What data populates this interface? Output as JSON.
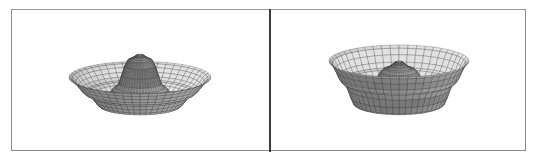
{
  "figure": {
    "panels": [
      {
        "id": "left",
        "caption": ""
      },
      {
        "id": "right",
        "caption": ""
      }
    ]
  },
  "chart_data": [
    {
      "type": "surface3d",
      "title": "",
      "style": "shaded wireframe mesh",
      "description": "Radially symmetric surface with a central peak and an upturned outer rim (sombrero-like)",
      "profile": {
        "r": [
          0,
          0.15,
          0.35,
          0.55,
          0.75,
          1.0
        ],
        "z": [
          1.0,
          0.9,
          0.35,
          0.0,
          0.25,
          0.55
        ]
      },
      "mesh": {
        "radial_lines": 24,
        "rings": 22
      },
      "colors": {
        "fill": "#b9b9b9",
        "line": "#2e2e2e"
      }
    },
    {
      "type": "surface3d",
      "title": "",
      "style": "shaded wireframe mesh",
      "description": "Radially symmetric surface with a central cone inside a wide flared rim above a cylindrical base",
      "profile": {
        "r": [
          0,
          0.2,
          0.45,
          0.62,
          0.8,
          1.0
        ],
        "z": [
          1.0,
          0.85,
          0.45,
          0.15,
          0.6,
          1.0
        ]
      },
      "mesh": {
        "radial_lines": 24,
        "rings": 22
      },
      "colors": {
        "fill": "#bdbdbd",
        "line": "#2e2e2e"
      }
    }
  ],
  "colors": {
    "background": "#ffffff",
    "frame_border": "#8a8a8a",
    "divider": "#3c3c3c"
  }
}
